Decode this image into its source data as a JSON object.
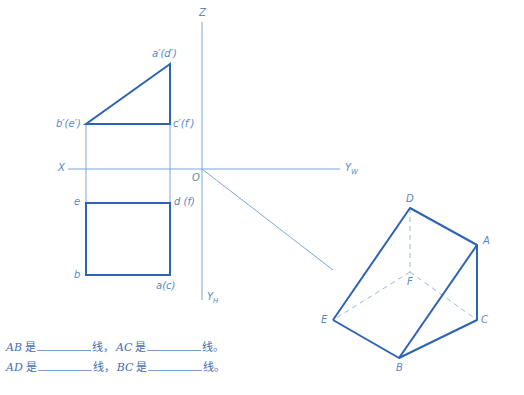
{
  "colors": {
    "thin_line": "#7ea4d8",
    "thick_line": "#2e62b5",
    "dash_line": "#9bb7df",
    "label": "#5a86c4",
    "text": "#3f6db5"
  },
  "axes": {
    "z_label": "Z",
    "x_label": "X",
    "origin_label": "O",
    "yw_label": "Y",
    "yw_sub": "W",
    "yh_label": "Y",
    "yh_sub": "H"
  },
  "front_view": {
    "labels": {
      "a": "a′(d′)",
      "b": "b′(e′)",
      "c": "c′(f′)"
    }
  },
  "top_view": {
    "labels": {
      "e": "e",
      "d": "d (f)",
      "b": "b",
      "a": "a(c)"
    }
  },
  "prism_3d": {
    "labels": {
      "D": "D",
      "A": "A",
      "F": "F",
      "E": "E",
      "C": "C",
      "B": "B"
    }
  },
  "questions": [
    {
      "seg1": "AB",
      "is1": "是",
      "suffix1": "线，",
      "seg2": "AC",
      "is2": "是",
      "suffix2": "线。"
    },
    {
      "seg1": "AD",
      "is1": "是",
      "suffix1": "线，",
      "seg2": "BC",
      "is2": "是",
      "suffix2": "线。"
    }
  ]
}
